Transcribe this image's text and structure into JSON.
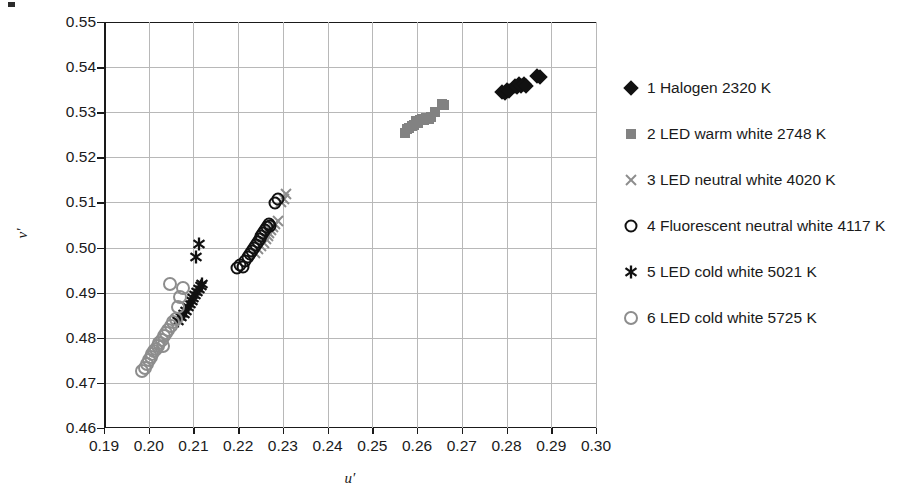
{
  "chart_data": {
    "type": "scatter",
    "title": "",
    "xlabel": "u′",
    "ylabel": "v′",
    "xlim": [
      0.19,
      0.3
    ],
    "ylim": [
      0.46,
      0.55
    ],
    "xticks": [
      "0.19",
      "0.20",
      "0.21",
      "0.22",
      "0.23",
      "0.24",
      "0.25",
      "0.26",
      "0.27",
      "0.28",
      "0.29",
      "0.30"
    ],
    "yticks": [
      "0.46",
      "0.47",
      "0.48",
      "0.49",
      "0.50",
      "0.51",
      "0.52",
      "0.53",
      "0.54",
      "0.55"
    ],
    "xtick_values": [
      0.19,
      0.2,
      0.21,
      0.22,
      0.23,
      0.24,
      0.25,
      0.26,
      0.27,
      0.28,
      0.29,
      0.3
    ],
    "ytick_values": [
      0.46,
      0.47,
      0.48,
      0.49,
      0.5,
      0.51,
      0.52,
      0.53,
      0.54,
      0.55
    ],
    "grid": true,
    "legend_position": "right",
    "series": [
      {
        "name": "1 Halogen 2320 K",
        "marker": "diamond-filled",
        "color": "#111111",
        "points": [
          [
            0.279,
            0.5345
          ],
          [
            0.2797,
            0.5343
          ],
          [
            0.2801,
            0.535
          ],
          [
            0.2805,
            0.5347
          ],
          [
            0.2818,
            0.5358
          ],
          [
            0.2824,
            0.5355
          ],
          [
            0.2828,
            0.5362
          ],
          [
            0.2833,
            0.5358
          ],
          [
            0.2838,
            0.5362
          ],
          [
            0.2843,
            0.5359
          ],
          [
            0.2869,
            0.538
          ],
          [
            0.2874,
            0.5378
          ]
        ]
      },
      {
        "name": "2 LED warm white 2748 K",
        "marker": "square-filled",
        "color": "#828282",
        "points": [
          [
            0.2572,
            0.5255
          ],
          [
            0.2577,
            0.5262
          ],
          [
            0.2583,
            0.5266
          ],
          [
            0.2588,
            0.527
          ],
          [
            0.2594,
            0.5272
          ],
          [
            0.2597,
            0.528
          ],
          [
            0.2601,
            0.5276
          ],
          [
            0.2606,
            0.5282
          ],
          [
            0.261,
            0.5285
          ],
          [
            0.2615,
            0.5283
          ],
          [
            0.262,
            0.5288
          ],
          [
            0.2626,
            0.5284
          ],
          [
            0.2632,
            0.529
          ],
          [
            0.2641,
            0.53
          ],
          [
            0.2656,
            0.5318
          ],
          [
            0.2661,
            0.5315
          ]
        ]
      },
      {
        "name": "3 LED neutral white 4020 K",
        "marker": "x-cross",
        "color": "#8d8d8d",
        "points": [
          [
            0.2238,
            0.4988
          ],
          [
            0.2245,
            0.4996
          ],
          [
            0.2252,
            0.5004
          ],
          [
            0.2258,
            0.5011
          ],
          [
            0.2263,
            0.5018
          ],
          [
            0.2266,
            0.5026
          ],
          [
            0.227,
            0.5032
          ],
          [
            0.2274,
            0.5038
          ],
          [
            0.2278,
            0.5046
          ],
          [
            0.2283,
            0.5052
          ],
          [
            0.2288,
            0.5058
          ],
          [
            0.2296,
            0.51
          ],
          [
            0.2303,
            0.5108
          ],
          [
            0.2308,
            0.5118
          ]
        ]
      },
      {
        "name": "4 Fluorescent neutral white 4117 K",
        "marker": "circle-open",
        "color": "#111111",
        "points": [
          [
            0.2198,
            0.4955
          ],
          [
            0.2205,
            0.4962
          ],
          [
            0.2211,
            0.4958
          ],
          [
            0.2216,
            0.497
          ],
          [
            0.2221,
            0.4978
          ],
          [
            0.2226,
            0.4985
          ],
          [
            0.223,
            0.4992
          ],
          [
            0.2235,
            0.4998
          ],
          [
            0.224,
            0.5005
          ],
          [
            0.2244,
            0.5012
          ],
          [
            0.2248,
            0.502
          ],
          [
            0.2252,
            0.5026
          ],
          [
            0.2256,
            0.5033
          ],
          [
            0.226,
            0.504
          ],
          [
            0.2264,
            0.5046
          ],
          [
            0.2268,
            0.5052
          ],
          [
            0.2272,
            0.5048
          ],
          [
            0.2282,
            0.5098
          ],
          [
            0.229,
            0.5107
          ]
        ]
      },
      {
        "name": "5 LED cold white 5021 K",
        "marker": "asterisk",
        "color": "#111111",
        "points": [
          [
            0.2066,
            0.4838
          ],
          [
            0.2072,
            0.4845
          ],
          [
            0.2078,
            0.4852
          ],
          [
            0.2083,
            0.486
          ],
          [
            0.2088,
            0.4868
          ],
          [
            0.2092,
            0.4875
          ],
          [
            0.2096,
            0.4882
          ],
          [
            0.21,
            0.4888
          ],
          [
            0.2104,
            0.4895
          ],
          [
            0.2108,
            0.4902
          ],
          [
            0.2112,
            0.4908
          ],
          [
            0.2116,
            0.4914
          ],
          [
            0.212,
            0.492
          ],
          [
            0.2105,
            0.4978
          ],
          [
            0.2113,
            0.5008
          ]
        ]
      },
      {
        "name": "6 LED cold white 5725 K",
        "marker": "circle-open",
        "color": "#8d8d8d",
        "points": [
          [
            0.1985,
            0.4726
          ],
          [
            0.1991,
            0.4734
          ],
          [
            0.1996,
            0.4742
          ],
          [
            0.2,
            0.475
          ],
          [
            0.2004,
            0.4757
          ],
          [
            0.2008,
            0.4764
          ],
          [
            0.2012,
            0.477
          ],
          [
            0.2016,
            0.4776
          ],
          [
            0.202,
            0.4782
          ],
          [
            0.2024,
            0.4789
          ],
          [
            0.2029,
            0.4796
          ],
          [
            0.2034,
            0.4803
          ],
          [
            0.2039,
            0.481
          ],
          [
            0.2044,
            0.4818
          ],
          [
            0.2049,
            0.4826
          ],
          [
            0.2055,
            0.4834
          ],
          [
            0.206,
            0.4842
          ],
          [
            0.2066,
            0.4868
          ],
          [
            0.2071,
            0.489
          ],
          [
            0.2076,
            0.491
          ],
          [
            0.2033,
            0.4782
          ],
          [
            0.2047,
            0.492
          ]
        ]
      }
    ]
  },
  "legend": {
    "items": [
      {
        "label": "1 Halogen 2320 K",
        "marker": "diamond-filled",
        "color": "#111111"
      },
      {
        "label": "2 LED warm white 2748 K",
        "marker": "square-filled",
        "color": "#828282"
      },
      {
        "label": "3 LED neutral white 4020 K",
        "marker": "x-cross",
        "color": "#8d8d8d"
      },
      {
        "label": "4 Fluorescent neutral white 4117 K",
        "marker": "circle-open",
        "color": "#111111"
      },
      {
        "label": "5 LED cold white 5021 K",
        "marker": "asterisk",
        "color": "#111111"
      },
      {
        "label": "6 LED cold white 5725 K",
        "marker": "circle-open",
        "color": "#8d8d8d"
      }
    ]
  },
  "colors": {
    "axis": "#1a1a1a",
    "grid": "#b8b8b8",
    "background": "#ffffff",
    "dark_marker": "#111111",
    "gray_marker": "#828282"
  }
}
